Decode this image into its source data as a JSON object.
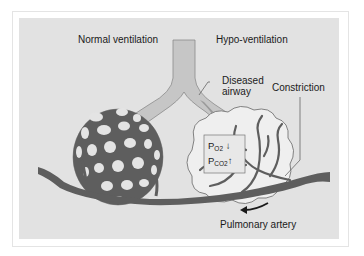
{
  "diagram": {
    "labels": {
      "normal_ventilation": "Normal ventilation",
      "hypo_ventilation": "Hypo-ventilation",
      "diseased_airway_line1": "Diseased",
      "diseased_airway_line2": "airway",
      "constriction": "Constriction",
      "pulmonary_artery": "Pulmonary artery"
    },
    "gas_box": {
      "po2_main": "P",
      "po2_sub": "O2",
      "po2_trend": "↓",
      "pco2_main": "P",
      "pco2_sub": "CO2",
      "pco2_trend": "↑"
    },
    "colors": {
      "background_panel": "#e2e2e2",
      "vessel": "#5e5e5e",
      "airway": "#c4c4c4",
      "hypo_alveolus": "#efefef"
    }
  }
}
